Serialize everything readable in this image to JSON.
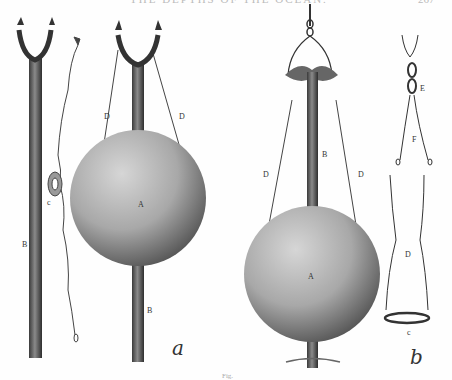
{
  "page": {
    "running_head": "THE DEPTHS OF THE OCEAN.",
    "page_number": "267"
  },
  "figure": {
    "panels": [
      {
        "id": "a",
        "caption_letter": "a",
        "labels": {
          "rod_left": "B",
          "ring": "c",
          "sphere": "A",
          "line_left": "D",
          "line_right": "D",
          "rod_right": "B"
        }
      },
      {
        "id": "b",
        "caption_letter": "b",
        "labels": {
          "sphere": "A",
          "rod": "B",
          "line_left": "D",
          "line_right": "D",
          "shackle": "E",
          "slings": "F",
          "sling_loop": "D",
          "ring": "c"
        }
      }
    ],
    "fig_caption_partial": "Fig."
  },
  "colors": {
    "ink": "#2a2a2a",
    "sphere_light": "#bdbdbd",
    "sphere_dark": "#555555",
    "paper": "#fefefe"
  }
}
